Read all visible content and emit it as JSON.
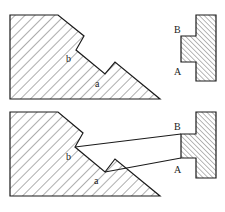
{
  "diagram": {
    "top": {
      "labels": {
        "b": "b",
        "a": "a",
        "B": "B",
        "A": "A"
      }
    },
    "bottom": {
      "labels": {
        "b": "b",
        "a": "a",
        "B": "B",
        "A": "A"
      }
    }
  },
  "colors": {
    "stroke": "#1a1a1a",
    "hatch": "#333333",
    "background": "#ffffff"
  }
}
